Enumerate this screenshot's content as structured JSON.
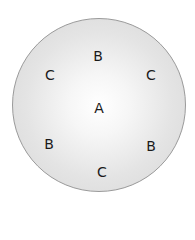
{
  "diagram": {
    "shape": "circle",
    "labels": [
      {
        "text": "A",
        "x": 99,
        "y": 108
      },
      {
        "text": "B",
        "x": 98,
        "y": 56
      },
      {
        "text": "C",
        "x": 50,
        "y": 75
      },
      {
        "text": "C",
        "x": 151,
        "y": 75
      },
      {
        "text": "B",
        "x": 49,
        "y": 144
      },
      {
        "text": "B",
        "x": 151,
        "y": 146
      },
      {
        "text": "C",
        "x": 102,
        "y": 172
      }
    ]
  }
}
